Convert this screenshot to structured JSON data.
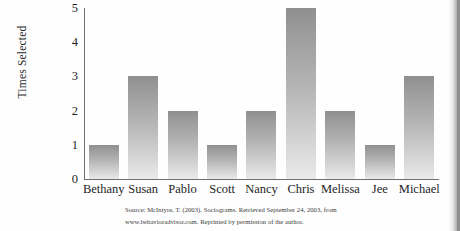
{
  "chart_data": {
    "type": "bar",
    "title": "",
    "xlabel": "",
    "ylabel": "Times Selected",
    "ylim": [
      0,
      5
    ],
    "yticks": [
      "0",
      "1",
      "2",
      "3",
      "4",
      "5"
    ],
    "grid": false,
    "legend": null,
    "categories": [
      "Bethany",
      "Susan",
      "Pablo",
      "Scott",
      "Nancy",
      "Chris",
      "Melissa",
      "Jee",
      "Michael"
    ],
    "values": [
      1,
      3,
      2,
      1,
      2,
      5,
      2,
      1,
      3
    ],
    "bar_color": "#a8a8a8",
    "axis_color": "#6f6f6f"
  },
  "caption": {
    "line1": "Source: McIntyre, T. (2003). Sociograms. Retrieved September 24, 2003, from",
    "line2": "www.behavioradvisor.com. Reprinted by permission of the author."
  }
}
